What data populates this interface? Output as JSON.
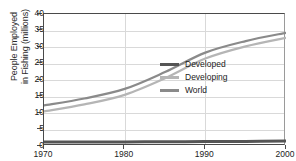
{
  "chart_data": {
    "type": "line",
    "title": "",
    "xlabel": "",
    "ylabel_line1": "People Employed",
    "ylabel_line2": "in Fishing (millions)",
    "x": [
      1970,
      1975,
      1980,
      1985,
      1990,
      1995,
      2000
    ],
    "xlim": [
      1970,
      2000
    ],
    "ylim": [
      0,
      40
    ],
    "xticks": [
      "1970",
      "1980",
      "1990",
      "2000"
    ],
    "yticks": [
      "0",
      "5",
      "10",
      "15",
      "20",
      "25",
      "30",
      "35",
      "40"
    ],
    "grid": "horizontal-and-vertical",
    "legend_position": "center-right-inside",
    "series": [
      {
        "name": "Developed",
        "color": "#555555",
        "values": [
          1.2,
          1.2,
          1.25,
          1.3,
          1.35,
          1.4,
          1.5
        ]
      },
      {
        "name": "Developing",
        "color": "#b5b5b5",
        "values": [
          10.5,
          12.6,
          15.5,
          20.5,
          26.5,
          30.2,
          32.8
        ]
      },
      {
        "name": "World",
        "color": "#8a8a8a",
        "values": [
          12.3,
          14.4,
          17.3,
          22.4,
          28.3,
          31.8,
          34.3
        ]
      }
    ]
  },
  "legend": {
    "items": [
      {
        "label": "Developed"
      },
      {
        "label": "Developing"
      },
      {
        "label": "World"
      }
    ]
  }
}
